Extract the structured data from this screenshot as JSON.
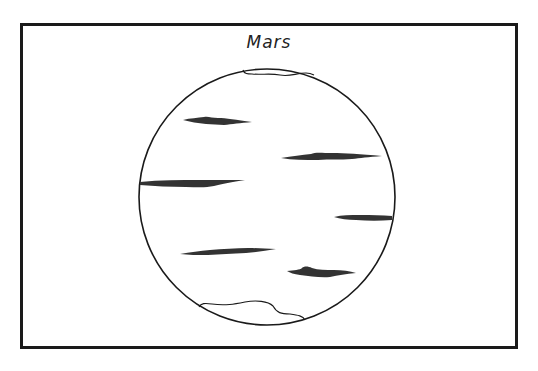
{
  "diagram": {
    "title": "Mars",
    "colors": {
      "border": "#1a1a1a",
      "outline": "#1a1a1a",
      "markings": "#333333",
      "background": "#ffffff"
    },
    "features": {
      "polar_caps": [
        "north-polar-cap",
        "south-polar-cap"
      ],
      "dark_markings_count": 6
    }
  }
}
